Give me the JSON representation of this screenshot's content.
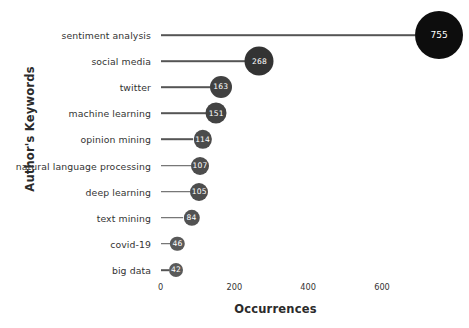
{
  "chart_data": {
    "type": "scatter",
    "subtype": "lollipop",
    "title": "",
    "xlabel": "Occurrences",
    "ylabel": "Author's Keywords",
    "xlim": [
      0,
      700
    ],
    "ylim": null,
    "grid": false,
    "legend": null,
    "xticks": [
      "0",
      "200",
      "400",
      "600"
    ],
    "xtick_values": [
      0,
      200,
      400,
      600
    ],
    "categories": [
      "sentiment analysis",
      "social media",
      "twitter",
      "machine learning",
      "opinion mining",
      "natural language processing",
      "deep learning",
      "text mining",
      "covid-19",
      "big data"
    ],
    "values": [
      755,
      268,
      163,
      151,
      114,
      107,
      105,
      84,
      46,
      42
    ],
    "point_labels": [
      "755",
      "268",
      "163",
      "151",
      "114",
      "107",
      "105",
      "84",
      "46",
      "42"
    ],
    "marker_colors": [
      "#0d0d0d",
      "#333333",
      "#414141",
      "#434343",
      "#4b4b4b",
      "#4d4d4d",
      "#4d4d4d",
      "#525252",
      "#595959",
      "#5a5a5a"
    ],
    "marker_radii_px": [
      24,
      14.5,
      11,
      10.5,
      9.2,
      9,
      9,
      8.2,
      7.2,
      7
    ],
    "stem_color": "#555555",
    "label_color": "#ffffff",
    "background": "#ffffff"
  },
  "axes": {
    "x_title": "Occurrences",
    "y_title": "Author's Keywords"
  }
}
